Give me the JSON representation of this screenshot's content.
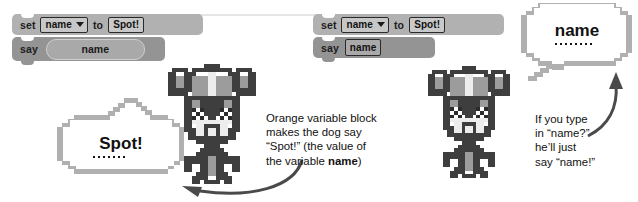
{
  "palette": {
    "background": "#ffffff",
    "block_set_fill": "#b1b1b1",
    "block_say_fill": "#949494",
    "field_border": "#2a2a2a",
    "oval_fill": "#a9a9a9",
    "bubble_outline": "#b0b0b0",
    "bubble_fill": "#ffffff",
    "text_color": "#111111",
    "dog_dark": "#3c3c3c",
    "dog_mid": "#9a9a9a",
    "dog_light": "#d2d2d2",
    "arrow_color": "#4a4a4a"
  },
  "left_example": {
    "blocks": [
      {
        "name": "set-block",
        "keyword": "set",
        "variable_field": "name",
        "field_type": "dropdown",
        "connector": "to",
        "value_field": "Spot!",
        "value_field_type": "text"
      },
      {
        "name": "say-block",
        "keyword": "say",
        "argument": "name",
        "argument_type": "variable-oval"
      }
    ],
    "bubble": {
      "text": "Spot!",
      "dot_count": 7
    },
    "caption": "Orange variable block\nmakes the dog say\n“Spot!” (the value of\nthe variable ",
    "caption_bold": "name",
    "caption_tail": ")"
  },
  "right_example": {
    "blocks": [
      {
        "name": "set-block",
        "keyword": "set",
        "variable_field": "name",
        "field_type": "dropdown",
        "connector": "to",
        "value_field": "Spot!",
        "value_field_type": "text"
      },
      {
        "name": "say-block",
        "keyword": "say",
        "argument": "name",
        "argument_type": "text-input"
      }
    ],
    "bubble": {
      "text": "name",
      "dot_count": 8
    },
    "caption": "If you type\nin “name?”\nhe’ll just\nsay “name!”"
  },
  "sprites": {
    "dog_left_name": "dog-sprite",
    "dog_right_name": "dog-sprite"
  },
  "arrows": {
    "left_arrow_name": "curved-arrow-to-spot-bubble",
    "right_arrow_name": "curved-arrow-to-name-bubble"
  }
}
